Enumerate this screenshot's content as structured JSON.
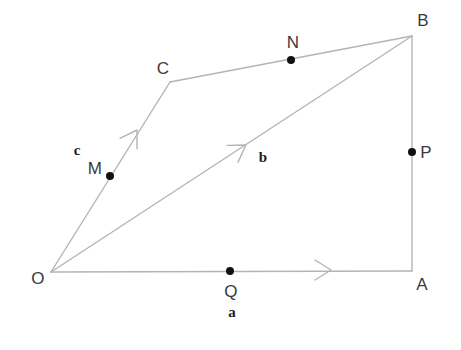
{
  "figure": {
    "type": "geometry-diagram",
    "width": 461,
    "height": 350,
    "background_color": "#ffffff",
    "line_color": "#b4b4b4",
    "dot_color": "#111111",
    "label_color": "#3a3a3a",
    "vector_label_color": "#1e1e1e"
  },
  "vertices": [
    {
      "id": "O",
      "label": "O",
      "x": 51,
      "y": 272,
      "label_x": 38,
      "label_y": 278
    },
    {
      "id": "A",
      "label": "A",
      "x": 412,
      "y": 271,
      "label_x": 422,
      "label_y": 284
    },
    {
      "id": "B",
      "label": "B",
      "x": 412,
      "y": 36,
      "label_x": 423,
      "label_y": 20
    },
    {
      "id": "C",
      "label": "C",
      "x": 170,
      "y": 82,
      "label_x": 163,
      "label_y": 68
    }
  ],
  "marked_points": [
    {
      "id": "M",
      "label": "M",
      "x": 110,
      "y": 176,
      "label_x": 95,
      "label_y": 168,
      "on_segment": "O-C"
    },
    {
      "id": "N",
      "label": "N",
      "x": 291,
      "y": 60,
      "label_x": 293,
      "label_y": 42,
      "on_segment": "C-B"
    },
    {
      "id": "P",
      "label": "P",
      "x": 412,
      "y": 152,
      "label_x": 426,
      "label_y": 152,
      "on_segment": "A-B"
    },
    {
      "id": "Q",
      "label": "Q",
      "x": 230,
      "y": 271,
      "label_x": 231,
      "label_y": 291,
      "on_segment": "O-A"
    }
  ],
  "segments": [
    {
      "id": "OA",
      "from": "O",
      "to": "A",
      "x1": 51,
      "y1": 272,
      "x2": 412,
      "y2": 271
    },
    {
      "id": "AB",
      "from": "A",
      "to": "B",
      "x1": 412,
      "y1": 271,
      "x2": 412,
      "y2": 36
    },
    {
      "id": "CB",
      "from": "C",
      "to": "B",
      "x1": 170,
      "y1": 82,
      "x2": 412,
      "y2": 36
    },
    {
      "id": "OC",
      "from": "O",
      "to": "C",
      "x1": 51,
      "y1": 272,
      "x2": 170,
      "y2": 82
    },
    {
      "id": "OB",
      "from": "O",
      "to": "B",
      "x1": 51,
      "y1": 272,
      "x2": 412,
      "y2": 36
    }
  ],
  "vectors": [
    {
      "id": "a",
      "label": "a",
      "along_segment": "OA",
      "label_x": 232,
      "label_y": 312,
      "arrow_x": 331,
      "arrow_y": 270,
      "arrow_angle_deg": 0
    },
    {
      "id": "b",
      "label": "b",
      "along_segment": "OB",
      "label_x": 263,
      "label_y": 157,
      "arrow_x": 246,
      "arrow_y": 145,
      "arrow_angle_deg": -33
    },
    {
      "id": "c",
      "label": "c",
      "along_segment": "OC",
      "label_x": 77,
      "label_y": 150,
      "arrow_x": 137,
      "arrow_y": 130,
      "arrow_angle_deg": -58
    }
  ]
}
